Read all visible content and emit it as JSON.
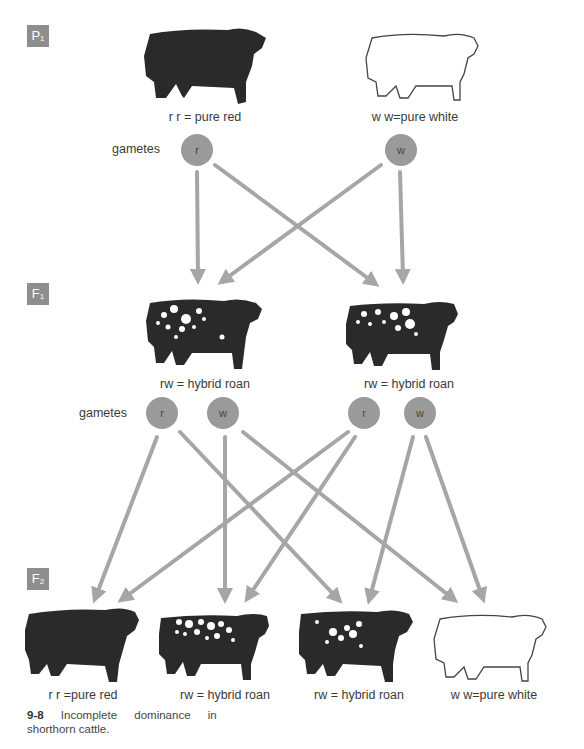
{
  "generations": [
    {
      "id": "P",
      "sub": "1"
    },
    {
      "id": "F",
      "sub": "1"
    },
    {
      "id": "F",
      "sub": "2"
    }
  ],
  "p1": {
    "red": {
      "genotype": "r r",
      "label": "r r = pure red"
    },
    "white": {
      "genotype": "w w",
      "label": "w w=pure white"
    },
    "gametes_label": "gametes",
    "gametes": [
      "r",
      "w"
    ]
  },
  "f1": {
    "left": {
      "label": "rw  =  hybrid roan"
    },
    "right": {
      "label": "rw  =  hybrid roan"
    },
    "gametes_label": "gametes",
    "gametes": [
      "r",
      "w",
      "r",
      "w"
    ]
  },
  "f2": {
    "offspring": [
      {
        "label": "r r =pure red",
        "type": "red"
      },
      {
        "label": "rw  =  hybrid roan",
        "type": "roan"
      },
      {
        "label": "rw  =  hybrid roan",
        "type": "roan"
      },
      {
        "label": "w w=pure white",
        "type": "white"
      }
    ]
  },
  "caption": {
    "number": "9-8",
    "line1": "Incomplete dominance in",
    "line2": "shorthorn cattle."
  },
  "colors": {
    "arrow": "#a6a6a6",
    "circle": "#9a9a9a",
    "label_box": "#8e8e8e",
    "cattle_dark": "#2a2a2a"
  }
}
